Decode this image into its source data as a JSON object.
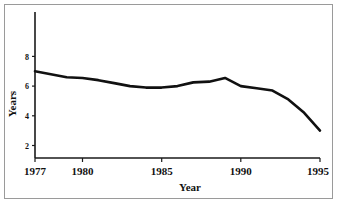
{
  "figure": {
    "background_color": "#ffffff",
    "frame_color": "#9a9a9a",
    "line_color": "#111111"
  },
  "chart_data": {
    "type": "line",
    "title": "",
    "xlabel": "Year",
    "ylabel": "Years",
    "xlim": [
      1977,
      1995
    ],
    "ylim": [
      0,
      9
    ],
    "xticks": [
      1977,
      1980,
      1985,
      1990,
      1995
    ],
    "xtick_labels": [
      "1977",
      "1980",
      "1985",
      "1990",
      "1995"
    ],
    "yticks": [
      2,
      4,
      6,
      8
    ],
    "ytick_labels": [
      "2",
      "4",
      "6",
      "8"
    ],
    "grid": false,
    "legend": false,
    "x": [
      1977,
      1978,
      1979,
      1980,
      1981,
      1982,
      1983,
      1984,
      1985,
      1986,
      1987,
      1988,
      1989,
      1990,
      1991,
      1992,
      1993,
      1994,
      1995
    ],
    "values": [
      7.0,
      6.8,
      6.6,
      6.55,
      6.4,
      6.2,
      6.0,
      5.9,
      5.9,
      6.0,
      6.25,
      6.3,
      6.55,
      6.0,
      5.85,
      5.7,
      5.1,
      4.2,
      3.0
    ],
    "series": [
      {
        "name": "Years",
        "values": [
          7.0,
          6.8,
          6.6,
          6.55,
          6.4,
          6.2,
          6.0,
          5.9,
          5.9,
          6.0,
          6.25,
          6.3,
          6.55,
          6.0,
          5.85,
          5.7,
          5.1,
          4.2,
          3.0
        ]
      }
    ]
  },
  "axis_titles": {
    "x": "Year",
    "y": "Years"
  },
  "xtick_text": {
    "t0": "1977",
    "t1": "1980",
    "t2": "1985",
    "t3": "1990",
    "t4": "1995"
  },
  "ytick_text": {
    "t0": "2",
    "t1": "4",
    "t2": "6",
    "t3": "8"
  }
}
